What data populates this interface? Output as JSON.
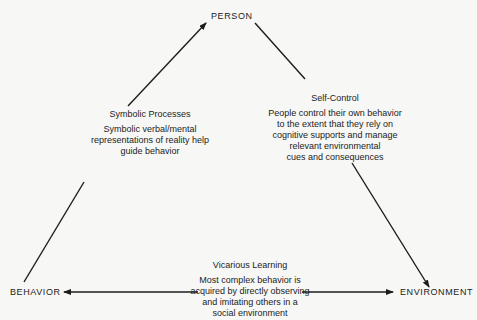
{
  "nodes": {
    "person": "PERSON",
    "behavior": "BEHAVIOR",
    "environment": "ENVIRONMENT"
  },
  "links": {
    "symbolic": {
      "title": "Symbolic Processes",
      "lines": [
        "Symbolic verbal/mental",
        "representations of reality help",
        "guide behavior"
      ]
    },
    "self_control": {
      "title": "Self-Control",
      "lines": [
        "People control their own behavior",
        "to the extent that they rely on",
        "cognitive supports and manage",
        "relevant environmental",
        "cues and consequences"
      ]
    },
    "vicarious": {
      "title": "Vicarious Learning",
      "lines": [
        "Most complex behavior is",
        "acquired by directly observing",
        "and imitating others in a",
        "social environment"
      ]
    }
  },
  "colors": {
    "background": "#f7f7f5",
    "ink": "#1c1c1c"
  }
}
